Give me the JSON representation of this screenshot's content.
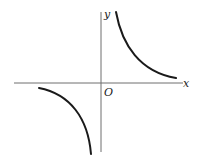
{
  "figure": {
    "type": "hyperbola-graph",
    "labels": {
      "x_axis": "x",
      "y_axis": "y",
      "origin": "O"
    },
    "colors": {
      "axis": "#6e6e6e",
      "curve": "#1a1a1a",
      "background": "#ffffff"
    },
    "branches": [
      {
        "name": "first-quadrant",
        "path": "M116,12 C122,45 140,72 176,78"
      },
      {
        "name": "third-quadrant",
        "path": "M39,88 C70,94 88,118 91,154"
      }
    ]
  }
}
